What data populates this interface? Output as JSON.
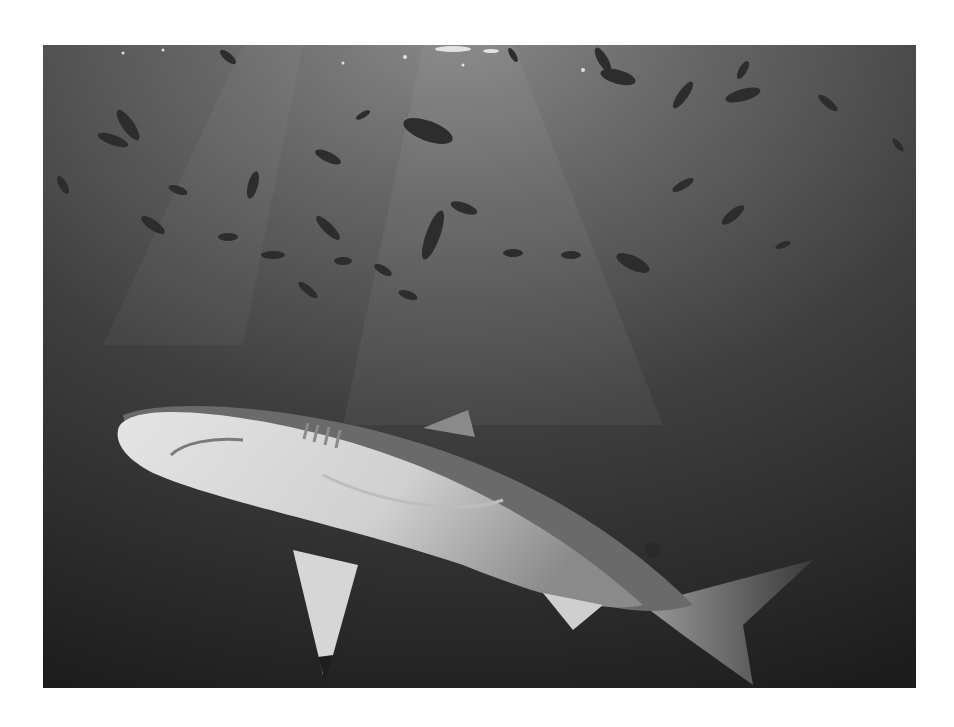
{
  "image": {
    "subject": "shark swimming beneath a school of fish",
    "description": "Grayscale underwater photograph of a reef shark viewed from below, with many small dark fish silhouetted against sunlit water above",
    "style": "monochrome",
    "frame": {
      "left": 43,
      "top": 45,
      "width": 873,
      "height": 643
    },
    "colors": {
      "background": "#ffffff",
      "water_light": "#7a7a7a",
      "water_mid": "#4a4a4a",
      "water_dark": "#1f1f1f",
      "shark_belly": "#d9d9d9",
      "shark_back": "#6a6a6a",
      "fish": "#2e2e2e"
    }
  }
}
